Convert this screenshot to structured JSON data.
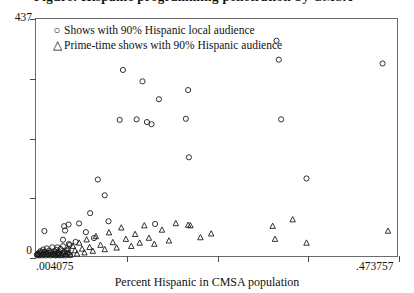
{
  "chart_data": {
    "type": "scatter",
    "title": "",
    "xlabel": "Percent Hispanic in CMSA population",
    "ylabel": "",
    "xlim": [
      0.004075,
      0.473757
    ],
    "ylim": [
      0,
      437
    ],
    "xticklabels": [
      " .004075",
      ".473757"
    ],
    "yticklabels": [
      "437",
      "0"
    ],
    "x_tick_count": 5,
    "y_tick_count": 5,
    "grid": false,
    "legend_position": "top-left",
    "marker_color": "#1a1a1a",
    "series": [
      {
        "name": "Shows with 90% Hispanic local audience",
        "marker": "circle",
        "points": [
          [
            0.0052,
            2
          ],
          [
            0.0061,
            4
          ],
          [
            0.0068,
            1
          ],
          [
            0.0075,
            3
          ],
          [
            0.0081,
            6
          ],
          [
            0.009,
            2
          ],
          [
            0.0098,
            9
          ],
          [
            0.0104,
            5
          ],
          [
            0.0112,
            1
          ],
          [
            0.0119,
            7
          ],
          [
            0.0127,
            3
          ],
          [
            0.0134,
            12
          ],
          [
            0.0141,
            2
          ],
          [
            0.015,
            5
          ],
          [
            0.0158,
            8
          ],
          [
            0.0166,
            1
          ],
          [
            0.0173,
            4
          ],
          [
            0.0181,
            14
          ],
          [
            0.0189,
            3
          ],
          [
            0.0197,
            6
          ],
          [
            0.0205,
            2
          ],
          [
            0.0213,
            10
          ],
          [
            0.0221,
            5
          ],
          [
            0.0229,
            1
          ],
          [
            0.0237,
            7
          ],
          [
            0.0245,
            3
          ],
          [
            0.0253,
            16
          ],
          [
            0.0262,
            4
          ],
          [
            0.027,
            2
          ],
          [
            0.0278,
            9
          ],
          [
            0.0287,
            5
          ],
          [
            0.0295,
            1
          ],
          [
            0.0304,
            11
          ],
          [
            0.0313,
            3
          ],
          [
            0.0322,
            6
          ],
          [
            0.0331,
            2
          ],
          [
            0.034,
            8
          ],
          [
            0.035,
            4
          ],
          [
            0.036,
            13
          ],
          [
            0.037,
            2
          ],
          [
            0.0381,
            5
          ],
          [
            0.0392,
            18
          ],
          [
            0.0403,
            3
          ],
          [
            0.0415,
            7
          ],
          [
            0.0427,
            1
          ],
          [
            0.044,
            10
          ],
          [
            0.0454,
            4
          ],
          [
            0.0468,
            22
          ],
          [
            0.0482,
            2
          ],
          [
            0.015,
            46
          ],
          [
            0.0318,
            16
          ],
          [
            0.0392,
            30
          ],
          [
            0.0407,
            55
          ],
          [
            0.0419,
            47
          ],
          [
            0.0464,
            58
          ],
          [
            0.0478,
            20
          ],
          [
            0.0556,
            26
          ],
          [
            0.0601,
            60
          ],
          [
            0.069,
            44
          ],
          [
            0.0745,
            79
          ],
          [
            0.0795,
            33
          ],
          [
            0.0845,
            141
          ],
          [
            0.0935,
            112
          ],
          [
            0.0984,
            64
          ],
          [
            0.113,
            251
          ],
          [
            0.1172,
            343
          ],
          [
            0.135,
            252
          ],
          [
            0.1426,
            322
          ],
          [
            0.1484,
            247
          ],
          [
            0.1544,
            243
          ],
          [
            0.159,
            59
          ],
          [
            0.164,
            289
          ],
          [
            0.199,
            253
          ],
          [
            0.202,
            306
          ],
          [
            0.203,
            182
          ],
          [
            0.317,
            397
          ],
          [
            0.32,
            362
          ],
          [
            0.323,
            252
          ],
          [
            0.356,
            143
          ],
          [
            0.455,
            355
          ]
        ]
      },
      {
        "name": "Prime-time shows with 90% Hispanic audience",
        "marker": "triangle",
        "points": [
          [
            0.0285,
            2
          ],
          [
            0.033,
            5
          ],
          [
            0.0366,
            1
          ],
          [
            0.0402,
            8
          ],
          [
            0.0437,
            3
          ],
          [
            0.0455,
            14
          ],
          [
            0.047,
            6
          ],
          [
            0.049,
            2
          ],
          [
            0.052,
            18
          ],
          [
            0.0548,
            10
          ],
          [
            0.0575,
            4
          ],
          [
            0.0602,
            24
          ],
          [
            0.064,
            13
          ],
          [
            0.0672,
            6
          ],
          [
            0.07,
            30
          ],
          [
            0.0738,
            16
          ],
          [
            0.078,
            9
          ],
          [
            0.082,
            36
          ],
          [
            0.088,
            20
          ],
          [
            0.0935,
            12
          ],
          [
            0.099,
            43
          ],
          [
            0.104,
            25
          ],
          [
            0.109,
            15
          ],
          [
            0.115,
            52
          ],
          [
            0.121,
            31
          ],
          [
            0.128,
            18
          ],
          [
            0.133,
            40
          ],
          [
            0.139,
            24
          ],
          [
            0.145,
            56
          ],
          [
            0.151,
            33
          ],
          [
            0.158,
            22
          ],
          [
            0.168,
            48
          ],
          [
            0.177,
            28
          ],
          [
            0.186,
            60
          ],
          [
            0.202,
            57
          ],
          [
            0.205,
            56
          ],
          [
            0.218,
            34
          ],
          [
            0.232,
            41
          ],
          [
            0.312,
            55
          ],
          [
            0.315,
            31
          ],
          [
            0.338,
            67
          ],
          [
            0.356,
            24
          ],
          [
            0.462,
            46
          ]
        ]
      }
    ]
  },
  "legend": {
    "items": [
      {
        "glyph": "○",
        "label": "Shows with 90% Hispanic local audience"
      },
      {
        "glyph": "△",
        "label": "Prime-time shows with 90% Hispanic audience"
      }
    ]
  },
  "axis": {
    "y_max_label": "437",
    "y_min_label": "0",
    "x_min_label": ".004075",
    "x_max_label": ".473757",
    "x_title": "Percent Hispanic in CMSA population"
  }
}
